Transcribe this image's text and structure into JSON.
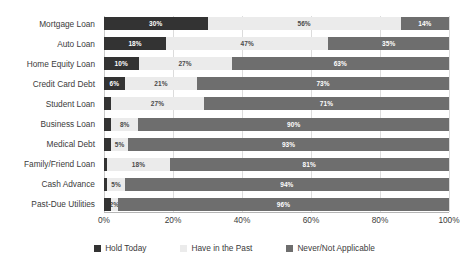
{
  "chart_data": {
    "type": "bar",
    "orientation": "horizontal",
    "stacked": true,
    "stack_mode": "percent",
    "title": "",
    "subtitle": "",
    "xlabel": "",
    "ylabel": "",
    "xlim": [
      0,
      100
    ],
    "xtick_labels": [
      "0%",
      "20%",
      "40%",
      "60%",
      "80%",
      "100%"
    ],
    "xtick_values": [
      0,
      20,
      40,
      60,
      80,
      100
    ],
    "grid": true,
    "grid_axis": "x",
    "legend_position": "bottom",
    "categories": [
      "Mortgage Loan",
      "Auto Loan",
      "Home Equity Loan",
      "Credit Card Debt",
      "Student Loan",
      "Business Loan",
      "Medical Debt",
      "Family/Friend Loan",
      "Cash Advance",
      "Past-Due Utilities"
    ],
    "series": [
      {
        "name": "Hold Today",
        "color": "#333333",
        "values": [
          30,
          18,
          10,
          6,
          2,
          2,
          2,
          1,
          1,
          2
        ],
        "labels": [
          "30%",
          "18%",
          "10%",
          "6%",
          "",
          "",
          "",
          "",
          "",
          ""
        ]
      },
      {
        "name": "Have in the Past",
        "color": "#ebebeb",
        "values": [
          56,
          47,
          27,
          21,
          27,
          8,
          5,
          18,
          5,
          2
        ],
        "labels": [
          "56%",
          "47%",
          "27%",
          "21%",
          "27%",
          "8%",
          "5%",
          "18%",
          "5%",
          "2%"
        ]
      },
      {
        "name": "Never/Not Applicable",
        "color": "#6e6e6e",
        "values": [
          14,
          35,
          63,
          73,
          71,
          90,
          93,
          81,
          94,
          96
        ],
        "labels": [
          "14%",
          "35%",
          "63%",
          "73%",
          "71%",
          "90%",
          "93%",
          "81%",
          "94%",
          "96%"
        ]
      }
    ]
  },
  "legend": {
    "items": [
      {
        "label": "Hold Today",
        "color": "#333333"
      },
      {
        "label": "Have in the Past",
        "color": "#ebebeb"
      },
      {
        "label": "Never/Not Applicable",
        "color": "#6e6e6e"
      }
    ]
  }
}
